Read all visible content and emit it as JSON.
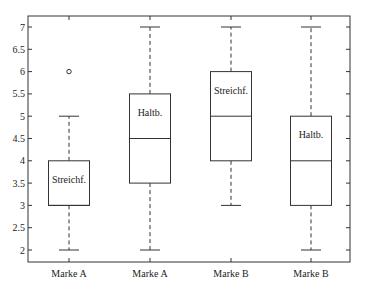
{
  "chart_data": {
    "type": "boxplot",
    "title": "",
    "xlabel": "",
    "ylabel": "",
    "ylim": [
      1.75,
      7.25
    ],
    "yticks": [
      2,
      2.5,
      3,
      3.5,
      4,
      4.5,
      5,
      5.5,
      6,
      6.5,
      7
    ],
    "ytick_labels": [
      "2",
      "2.5",
      "3",
      "3.5",
      "4",
      "4.5",
      "5",
      "5.5",
      "6",
      "6.5",
      "7"
    ],
    "grid": false,
    "categories": [
      "Marke A",
      "Marke A",
      "Marke B",
      "Marke B"
    ],
    "series": [
      {
        "name": "Marke A",
        "annotation": "Streichf.",
        "whisker_low": 2,
        "q1": 3,
        "median": 3,
        "q3": 4,
        "whisker_high": 5,
        "outliers": [
          6
        ]
      },
      {
        "name": "Marke A",
        "annotation": "Haltb.",
        "whisker_low": 2,
        "q1": 3.5,
        "median": 4.5,
        "q3": 5.5,
        "whisker_high": 7,
        "outliers": []
      },
      {
        "name": "Marke B",
        "annotation": "Streichf.",
        "whisker_low": 3,
        "q1": 4,
        "median": 5,
        "q3": 6,
        "whisker_high": 7,
        "outliers": []
      },
      {
        "name": "Marke B",
        "annotation": "Haltb.",
        "whisker_low": 2,
        "q1": 3,
        "median": 4,
        "q3": 5,
        "whisker_high": 7,
        "outliers": []
      }
    ],
    "colors": {
      "line": "#333333",
      "background": "#ffffff"
    }
  }
}
